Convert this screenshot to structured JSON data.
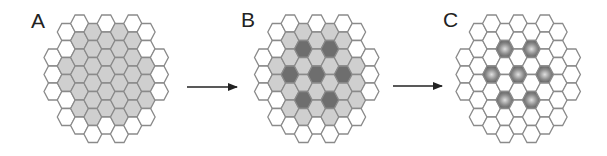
{
  "figure": {
    "panels": [
      {
        "label": "A",
        "label_x": 31,
        "label_y": 28,
        "origin_x": 53,
        "mode": "region"
      },
      {
        "label": "B",
        "label_x": 241,
        "label_y": 27,
        "origin_x": 263.5,
        "mode": "region_with_centers"
      },
      {
        "label": "C",
        "label_x": 443,
        "label_y": 27,
        "origin_x": 465,
        "mode": "centers_only"
      }
    ],
    "arrows": [
      {
        "x1": 187,
        "x2": 238,
        "y": 87
      },
      {
        "x1": 393,
        "x2": 443,
        "y": 86
      }
    ],
    "grid": {
      "col_spacing": 13.3,
      "row_height": 17,
      "hex_radius": 9.0,
      "top_y_even": 15,
      "top_y_odd": 23.5,
      "columns": [
        {
          "col": 0,
          "start_row": 2,
          "count": 3
        },
        {
          "col": 1,
          "start_row": 0,
          "count": 6
        },
        {
          "col": 2,
          "start_row": 0,
          "count": 7
        },
        {
          "col": 3,
          "start_row": 0,
          "count": 7
        },
        {
          "col": 4,
          "start_row": 0,
          "count": 7
        },
        {
          "col": 5,
          "start_row": 0,
          "count": 7
        },
        {
          "col": 6,
          "start_row": 0,
          "count": 7
        },
        {
          "col": 7,
          "start_row": 0,
          "count": 6
        },
        {
          "col": 8,
          "start_row": 2,
          "count": 3
        }
      ],
      "shaded_cells": [
        [
          1,
          2
        ],
        [
          1,
          3
        ],
        [
          2,
          1
        ],
        [
          2,
          2
        ],
        [
          2,
          3
        ],
        [
          2,
          4
        ],
        [
          2,
          5
        ],
        [
          3,
          0
        ],
        [
          3,
          1
        ],
        [
          3,
          2
        ],
        [
          3,
          3
        ],
        [
          3,
          4
        ],
        [
          3,
          5
        ],
        [
          4,
          1
        ],
        [
          4,
          2
        ],
        [
          4,
          3
        ],
        [
          4,
          4
        ],
        [
          4,
          5
        ],
        [
          5,
          0
        ],
        [
          5,
          1
        ],
        [
          5,
          2
        ],
        [
          5,
          3
        ],
        [
          5,
          4
        ],
        [
          5,
          5
        ],
        [
          6,
          1
        ],
        [
          6,
          2
        ],
        [
          6,
          3
        ],
        [
          6,
          4
        ],
        [
          6,
          5
        ],
        [
          7,
          2
        ],
        [
          7,
          3
        ],
        [
          7,
          4
        ]
      ],
      "center_cells": [
        [
          3,
          1
        ],
        [
          5,
          1
        ],
        [
          2,
          3
        ],
        [
          4,
          3
        ],
        [
          6,
          3
        ],
        [
          3,
          4
        ],
        [
          5,
          4
        ]
      ]
    },
    "colors": {
      "outline": "#8a8a8a",
      "empty": "#ffffff",
      "shaded": "#cfcfcf",
      "center_dark": "#6e6e6e",
      "center_light": "#d8d8d8",
      "arrow": "#222222",
      "label": "#222222"
    }
  }
}
